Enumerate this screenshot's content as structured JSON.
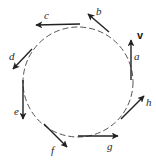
{
  "diagram": {
    "path": {
      "shape": "circle",
      "style": "dashed",
      "cx": 78,
      "cy": 82,
      "r": 55,
      "color": "#555555"
    },
    "vector_symbol": {
      "text": "v",
      "x": 137,
      "y": 39
    },
    "arrow_color": "#222222",
    "vectors": [
      {
        "label": "a",
        "x1": 131,
        "y1": 80,
        "x2": 131,
        "y2": 40,
        "lx": 134,
        "ly": 60
      },
      {
        "label": "b",
        "x1": 109,
        "y1": 32,
        "x2": 88,
        "y2": 14,
        "lx": 96,
        "ly": 15
      },
      {
        "label": "c",
        "x1": 80,
        "y1": 24,
        "x2": 36,
        "y2": 25,
        "lx": 44,
        "ly": 19
      },
      {
        "label": "d",
        "x1": 32,
        "y1": 49,
        "x2": 13,
        "y2": 69,
        "lx": 9,
        "ly": 60
      },
      {
        "label": "e",
        "x1": 23,
        "y1": 80,
        "x2": 23,
        "y2": 119,
        "lx": 14,
        "ly": 115
      },
      {
        "label": "f",
        "x1": 44,
        "y1": 124,
        "x2": 67,
        "y2": 147,
        "lx": 51,
        "ly": 154
      },
      {
        "label": "g",
        "x1": 78,
        "y1": 136,
        "x2": 118,
        "y2": 136,
        "lx": 107,
        "ly": 150
      },
      {
        "label": "h",
        "x1": 121,
        "y1": 119,
        "x2": 144,
        "y2": 96,
        "lx": 146,
        "ly": 106
      }
    ]
  }
}
